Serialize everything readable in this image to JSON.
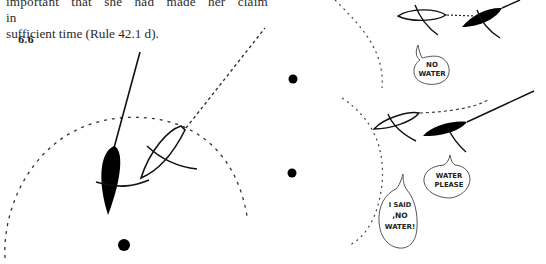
{
  "page": {
    "paragraph": {
      "lines": [
        "important that she had made her claim in",
        "sufficient time (Rule 42.1 d)."
      ]
    },
    "figure": {
      "number": "6.6"
    },
    "speech_bubbles": [
      {
        "id": "no-water",
        "lines": [
          "NO",
          "WATER"
        ]
      },
      {
        "id": "water-please",
        "lines": [
          "WATER",
          "PLEASE"
        ]
      },
      {
        "id": "i-said-no-water",
        "lines": [
          "I SAID",
          ",NO",
          "WATER!"
        ]
      }
    ]
  }
}
